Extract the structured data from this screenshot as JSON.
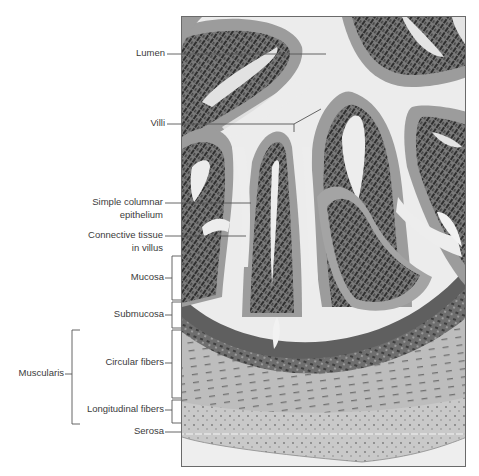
{
  "figure": {
    "type": "labeled histology micrograph",
    "colors": {
      "label_text": "#3b3b3b",
      "leader_line": "#555555",
      "frame": "#6a6a6a",
      "lumen": "#ececec",
      "epithelium": "#9a9a9a",
      "nuclei": "#3a3a3a",
      "connective_tissue": "#c8c8c8",
      "muscularis": "#b9b9b9",
      "serosa_line": "#f2f2f2"
    }
  },
  "labels": {
    "lumen": "Lumen",
    "villi": "Villi",
    "simple_columnar_line1": "Simple columnar",
    "simple_columnar_line2": "epithelium",
    "connective_line1": "Connective tissue",
    "connective_line2": "in villus",
    "mucosa": "Mucosa",
    "submucosa": "Submucosa",
    "muscularis": "Muscularis",
    "circular_fibers": "Circular fibers",
    "longitudinal_fibers": "Longitudinal fibers",
    "serosa": "Serosa"
  },
  "layer_brackets": [
    {
      "name": "Mucosa",
      "y_top": 256,
      "y_bottom": 300
    },
    {
      "name": "Submucosa",
      "y_top": 302,
      "y_bottom": 328
    },
    {
      "name": "Circular fibers",
      "y_top": 330,
      "y_bottom": 398
    },
    {
      "name": "Longitudinal fibers",
      "y_top": 400,
      "y_bottom": 423
    },
    {
      "name": "Muscularis",
      "y_top": 330,
      "y_bottom": 424
    }
  ]
}
